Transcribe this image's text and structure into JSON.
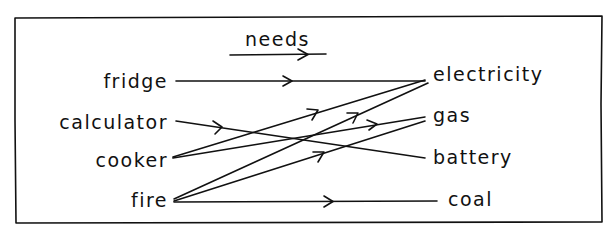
{
  "diagram": {
    "type": "relation-mapping",
    "legend": {
      "label": "needs",
      "direction": "left-to-right"
    },
    "sources": [
      {
        "id": "fridge",
        "label": "fridge"
      },
      {
        "id": "calculator",
        "label": "calculator"
      },
      {
        "id": "cooker",
        "label": "cooker"
      },
      {
        "id": "fire",
        "label": "fire"
      }
    ],
    "targets": [
      {
        "id": "electricity",
        "label": "electricity"
      },
      {
        "id": "gas",
        "label": "gas"
      },
      {
        "id": "battery",
        "label": "battery"
      },
      {
        "id": "coal",
        "label": "coal"
      }
    ],
    "edges": [
      {
        "from": "fridge",
        "to": "electricity",
        "relation": "needs"
      },
      {
        "from": "calculator",
        "to": "battery",
        "relation": "needs"
      },
      {
        "from": "cooker",
        "to": "electricity",
        "relation": "needs"
      },
      {
        "from": "cooker",
        "to": "gas",
        "relation": "needs"
      },
      {
        "from": "fire",
        "to": "electricity",
        "relation": "needs"
      },
      {
        "from": "fire",
        "to": "gas",
        "relation": "needs"
      },
      {
        "from": "fire",
        "to": "coal",
        "relation": "needs"
      }
    ],
    "colors": {
      "ink": "#111111",
      "background": "#ffffff"
    }
  }
}
